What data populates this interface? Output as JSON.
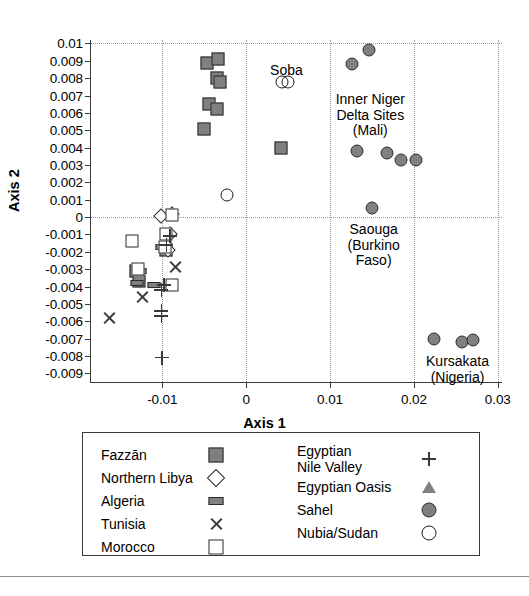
{
  "chart_data": {
    "type": "scatter",
    "title": "",
    "xlabel": "Axis 1",
    "ylabel": "Axis 2",
    "xlim": [
      -0.0185,
      0.0305
    ],
    "ylim": [
      -0.0095,
      0.0102
    ],
    "xticks": [
      "-0.01",
      "0",
      "0.01",
      "0.02",
      "0.03"
    ],
    "xtick_values": [
      -0.01,
      0,
      0.01,
      0.02,
      0.03
    ],
    "yticks": [
      "0.01",
      "0.009",
      "0.008",
      "0.007",
      "0.006",
      "0.005",
      "0.004",
      "0.003",
      "0.002",
      "0.001",
      "0",
      "-0.001",
      "-0.002",
      "-0.003",
      "-0.004",
      "-0.005",
      "-0.006",
      "-0.007",
      "-0.008",
      "-0.009"
    ],
    "ytick_values": [
      0.01,
      0.009,
      0.008,
      0.007,
      0.006,
      0.005,
      0.004,
      0.003,
      0.002,
      0.001,
      0,
      -0.001,
      -0.002,
      -0.003,
      -0.004,
      -0.005,
      -0.006,
      -0.007,
      -0.008,
      -0.009
    ],
    "grid": "dotted gridlines at x = -0.01, 0, 0.01, 0.02, 0.03 and y = 0.01, 0",
    "legend_position": "below-plot",
    "series": [
      {
        "name": "Fazzan",
        "marker": "filled-grey-square",
        "color": "#808080",
        "points": [
          [
            -0.0047,
            0.0089
          ],
          [
            -0.0034,
            0.0091
          ],
          [
            -0.0035,
            0.008
          ],
          [
            -0.0031,
            0.0078
          ],
          [
            -0.0044,
            0.0065
          ],
          [
            -0.0035,
            0.0062
          ],
          [
            -0.005,
            0.0051
          ],
          [
            0.0042,
            0.004
          ],
          [
            -0.0096,
            -0.0019
          ],
          [
            -0.0131,
            -0.0031
          ],
          [
            -0.0128,
            -0.0037
          ]
        ]
      },
      {
        "name": "Northern Libya",
        "marker": "open-diamond",
        "color": "#ffffff",
        "points": [
          [
            -0.0101,
            5e-05
          ],
          [
            -0.0089,
            0.00015
          ],
          [
            -0.0091,
            -0.001
          ],
          [
            -0.0093,
            -0.0019
          ]
        ]
      },
      {
        "name": "Algeria",
        "marker": "filled-grey-rect",
        "color": "#808080",
        "points": [
          [
            -0.01,
            -0.0017
          ],
          [
            -0.0126,
            -0.0031
          ],
          [
            -0.013,
            -0.0038
          ],
          [
            -0.011,
            -0.0039
          ]
        ]
      },
      {
        "name": "Tunisia",
        "marker": "cross-x",
        "color": "#3a3a3a",
        "points": [
          [
            -0.0085,
            -0.0029
          ],
          [
            -0.0124,
            -0.0046
          ],
          [
            -0.0163,
            -0.0058
          ]
        ]
      },
      {
        "name": "Morocco",
        "marker": "open-square",
        "color": "#ffffff",
        "points": [
          [
            -0.0089,
            0.0001
          ],
          [
            -0.0095,
            -0.001
          ],
          [
            -0.0136,
            -0.0014
          ],
          [
            -0.0097,
            -0.0017
          ],
          [
            -0.0129,
            -0.003
          ],
          [
            -0.0088,
            -0.0039
          ]
        ]
      },
      {
        "name": "Egyptian Nile Valley",
        "marker": "plus",
        "color": "#3a3a3a",
        "points": [
          [
            -0.0091,
            -0.0011
          ],
          [
            -0.0095,
            -0.0016
          ],
          [
            -0.0098,
            -0.0039
          ],
          [
            -0.0101,
            -0.0042
          ],
          [
            -0.0101,
            -0.0054
          ],
          [
            -0.0101,
            -0.0057
          ],
          [
            -0.01,
            -0.0081
          ]
        ]
      },
      {
        "name": "Egyptian Oasis",
        "marker": "open-triangle",
        "color": "#808080",
        "points": []
      },
      {
        "name": "Sahel",
        "marker": "filled-grey-circle",
        "color": "#808080",
        "points": [
          [
            0.0126,
            0.0088
          ],
          [
            0.0146,
            0.0096
          ],
          [
            0.0132,
            0.0038
          ],
          [
            0.0168,
            0.0037
          ],
          [
            0.0184,
            0.0033
          ],
          [
            0.0203,
            0.0033
          ],
          [
            0.015,
            0.0005
          ],
          [
            0.0224,
            -0.007
          ],
          [
            0.0257,
            -0.0072
          ],
          [
            0.0271,
            -0.0071
          ]
        ]
      },
      {
        "name": "Nubia/Sudan",
        "marker": "open-circle",
        "color": "#ffffff",
        "points": [
          [
            0.0043,
            0.0078
          ],
          [
            0.005,
            0.0078
          ],
          [
            -0.0023,
            0.0013
          ]
        ]
      }
    ],
    "annotations": [
      {
        "text": "Soba",
        "x": 0.0048,
        "y": 0.0089
      },
      {
        "text": "Inner Niger\nDelta Sites\n(Mali)",
        "x": 0.0148,
        "y": 0.0072
      },
      {
        "text": "Saouga\n(Burkino\nFaso)",
        "x": 0.0152,
        "y": -0.0003
      },
      {
        "text": "Kursakata\n(Nigeria)",
        "x": 0.0252,
        "y": -0.0079
      }
    ]
  },
  "axes": {
    "x_label": "Axis 1",
    "y_label": "Axis 2"
  },
  "legend": {
    "left_column": [
      {
        "label": "Fazzān",
        "marker": "filled-grey-square"
      },
      {
        "label": "Northern Libya",
        "marker": "open-diamond"
      },
      {
        "label": "Algeria",
        "marker": "filled-grey-rect"
      },
      {
        "label": "Tunisia",
        "marker": "cross-x"
      },
      {
        "label": "Morocco",
        "marker": "open-square"
      }
    ],
    "right_column": [
      {
        "label": "Egyptian\nNile Valley",
        "marker": "plus"
      },
      {
        "label": "Egyptian Oasis",
        "marker": "open-triangle"
      },
      {
        "label": "Sahel",
        "marker": "filled-grey-circle"
      },
      {
        "label": "Nubia/Sudan",
        "marker": "open-circle"
      }
    ]
  },
  "colors": {
    "marker_fill": "#808080",
    "marker_stroke": "#2b2b2b",
    "axis": "#3a3a3a",
    "grid": "#9a9a9a",
    "background": "#ffffff"
  }
}
